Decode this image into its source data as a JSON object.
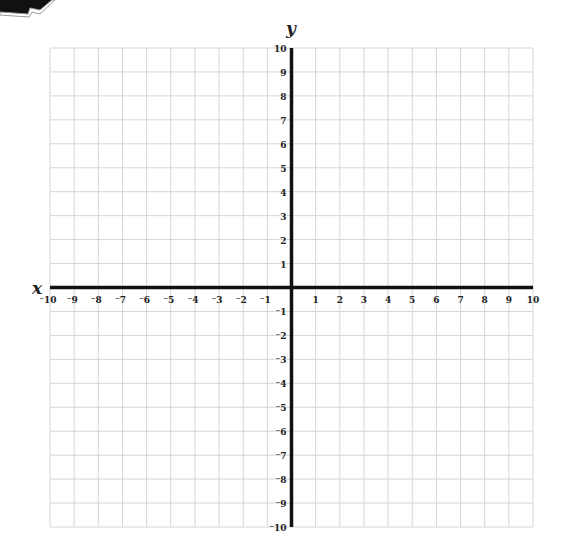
{
  "chart_data": {
    "type": "coordinate-grid",
    "title": "",
    "xlabel": "x",
    "ylabel": "y",
    "xlim": [
      -10,
      10
    ],
    "ylim": [
      -10,
      10
    ],
    "grid": true,
    "x_ticks": [
      -10,
      -9,
      -8,
      -7,
      -6,
      -5,
      -4,
      -3,
      -2,
      -1,
      1,
      2,
      3,
      4,
      5,
      6,
      7,
      8,
      9,
      10
    ],
    "y_ticks": [
      10,
      9,
      8,
      7,
      6,
      5,
      4,
      3,
      2,
      1,
      -1,
      -2,
      -3,
      -4,
      -5,
      -6,
      -7,
      -8,
      -9,
      -10
    ],
    "data_points": []
  },
  "axis": {
    "x_label": "x",
    "y_label": "y"
  },
  "colors": {
    "grid": "#d6d6d6",
    "axis": "#111111",
    "text": "#222222"
  }
}
